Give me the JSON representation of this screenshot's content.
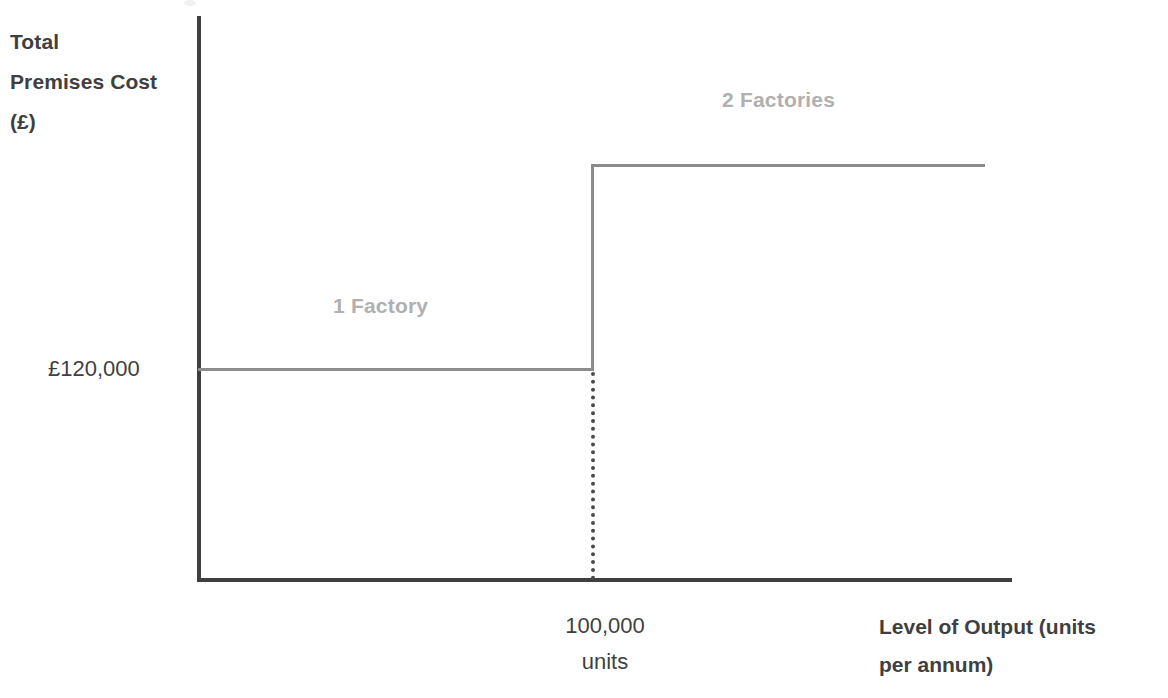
{
  "chart_data": {
    "type": "line",
    "title": "",
    "subtitle": "",
    "xlabel": "Level of Output (units per annum)",
    "ylabel": "Total Premises Cost (£)",
    "x_tick_labels": [
      "100,000 units"
    ],
    "y_tick_labels": [
      "£120,000"
    ],
    "annotations": [
      "1 Factory",
      "2 Factories"
    ],
    "grid": false,
    "legend": "none",
    "series": [
      {
        "name": "Total Premises Cost",
        "shape": "step",
        "points": [
          {
            "x": 0,
            "y": 120000,
            "label": "£120,000"
          },
          {
            "x": 100000,
            "y": 120000,
            "label": "£120,000"
          },
          {
            "x": 100000,
            "y": 240000,
            "label": ""
          },
          {
            "x": 200000,
            "y": 240000,
            "label": ""
          }
        ]
      }
    ],
    "step_threshold": {
      "x": 100000,
      "x_label": "100,000",
      "x_units": "units"
    },
    "xlim": [
      0,
      200000
    ],
    "ylim": [
      0,
      300000
    ]
  },
  "axes": {
    "y_title": "Total\nPremises Cost\n(£)",
    "x_title": "Level of Output (units\nper annum)",
    "y_tick": "£120,000",
    "x_tick": "100,000\nunits"
  },
  "regions": {
    "left_label": "1 Factory",
    "right_label": "2 Factories"
  },
  "colors": {
    "axis": "#3f3f3f",
    "step_line": "#8c8c8c",
    "dotted_line": "#4a4a4a",
    "text": "#3f3f3f",
    "region_label": "#b0b0b0",
    "background": "#ffffff"
  }
}
